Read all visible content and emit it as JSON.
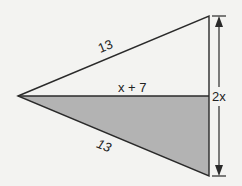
{
  "diagram": {
    "type": "geometry-figure",
    "labels": {
      "upper_side": "13",
      "lower_side": "13",
      "altitude": "x + 7",
      "base": "2x"
    },
    "colors": {
      "background": "#f3f3f1",
      "stroke": "#2a2a2a",
      "shaded_region": "#b3b3b3"
    },
    "vertices": {
      "apex": [
        18,
        96
      ],
      "top_right": [
        209,
        16
      ],
      "bottom_right": [
        209,
        176
      ],
      "midpoint": [
        209,
        96
      ]
    }
  }
}
